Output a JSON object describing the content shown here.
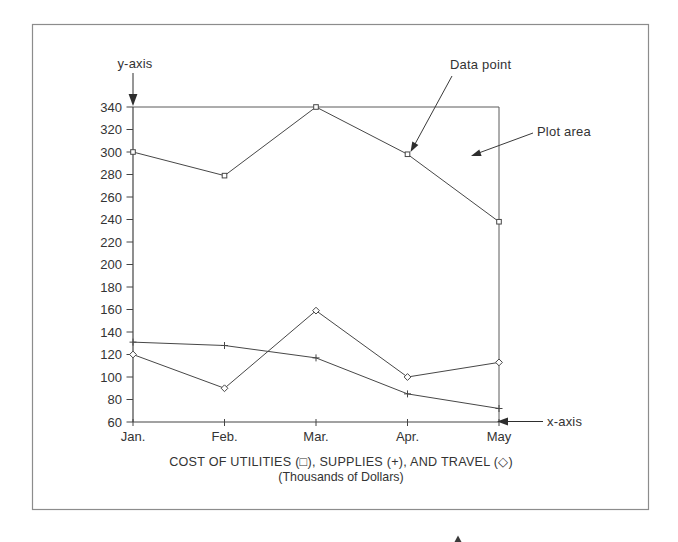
{
  "annotations": {
    "y_axis_label": "y-axis",
    "x_axis_label": "x-axis",
    "data_point_label": "Data point",
    "plot_area_label": "Plot area"
  },
  "chart_data": {
    "type": "line",
    "title": "COST OF UTILITIES (□), SUPPLIES (+), AND TRAVEL (◇)",
    "subtitle": "(Thousands of Dollars)",
    "categories": [
      "Jan.",
      "Feb.",
      "Mar.",
      "Apr.",
      "May"
    ],
    "series": [
      {
        "name": "Utilities",
        "marker": "square",
        "values": [
          300,
          279,
          340,
          298,
          238
        ]
      },
      {
        "name": "Supplies",
        "marker": "plus",
        "values": [
          131,
          128,
          117,
          85,
          72
        ]
      },
      {
        "name": "Travel",
        "marker": "diamond",
        "values": [
          120,
          90,
          159,
          100,
          113
        ]
      }
    ],
    "ylim": [
      60,
      340
    ],
    "yticks": [
      340,
      320,
      300,
      280,
      260,
      240,
      220,
      200,
      180,
      160,
      140,
      120,
      100,
      80,
      60
    ],
    "xlabel": "",
    "ylabel": "",
    "grid": false,
    "legend_position": "in-caption"
  },
  "colors": {
    "line": "#474747",
    "text": "#333333",
    "frame": "#8c8c8c",
    "background": "#ffffff"
  }
}
